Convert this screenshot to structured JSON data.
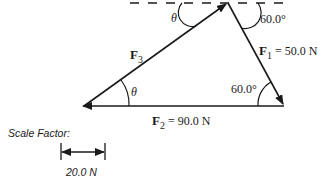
{
  "diagram": {
    "type": "vector-triangle",
    "forces": {
      "f1": {
        "symbol": "F",
        "subscript": "1",
        "value_text": " = 50.0 N",
        "magnitude": 50.0,
        "unit": "N"
      },
      "f2": {
        "symbol": "F",
        "subscript": "2",
        "value_text": " = 90.0 N",
        "magnitude": 90.0,
        "unit": "N"
      },
      "f3": {
        "symbol": "F",
        "subscript": "3"
      }
    },
    "angles": {
      "theta_top": "θ",
      "theta_left": "θ",
      "top_right": "60.0°",
      "bottom_right": "60.0°"
    },
    "scale": {
      "title": "Scale Factor:",
      "value_label": "20.0 N"
    },
    "colors": {
      "line": "#1a1a1a",
      "background": "#ffffff"
    }
  }
}
